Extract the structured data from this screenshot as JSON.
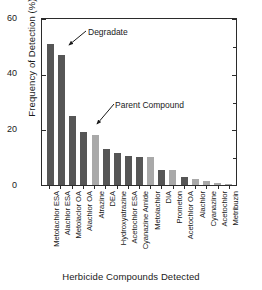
{
  "chart_data": {
    "type": "bar",
    "title": "",
    "xlabel": "Herbicide Compounds Detected",
    "ylabel": "Frequency of Detection (%)",
    "ylim": [
      0,
      60
    ],
    "yticks": [
      0,
      20,
      40,
      60
    ],
    "ytick_labels": [
      "0",
      "20",
      "40",
      "60"
    ],
    "y_minor_ticks": [
      10,
      30,
      50
    ],
    "grid": false,
    "legend_position": "none",
    "categories": [
      "Metolachlor ESA",
      "Alachlor ESA",
      "Metolaclor OA",
      "Alachlor OA",
      "Atrazine",
      "DEA",
      "Hydroxyatrazine",
      "Acetochlor ESA",
      "Cyanazine Amide",
      "Metolachlor",
      "DIA",
      "Prometon",
      "Acetochlor OA",
      "Alachlor",
      "Cyanazine",
      "Acetochlor",
      "Metribuzin"
    ],
    "values": [
      51,
      47,
      25,
      19,
      18,
      13,
      11.5,
      10.5,
      10,
      10,
      5.5,
      5.5,
      3,
      2,
      1.5,
      0.7,
      0.5
    ],
    "bar_classes": [
      "degradate",
      "degradate",
      "degradate",
      "degradate",
      "parent",
      "degradate",
      "degradate",
      "degradate",
      "degradate",
      "parent",
      "degradate",
      "parent",
      "degradate",
      "parent",
      "parent",
      "parent",
      "parent"
    ],
    "annotations": [
      {
        "label": "Degradate",
        "points_to": "Alachlor ESA"
      },
      {
        "label": "Parent Compound",
        "points_to": "Atrazine"
      }
    ],
    "colors": {
      "degradate": "#565656",
      "parent": "#a9a9a9",
      "axis": "#2b2b2b",
      "background": "#ffffff",
      "text": "#1a1a1a"
    }
  }
}
